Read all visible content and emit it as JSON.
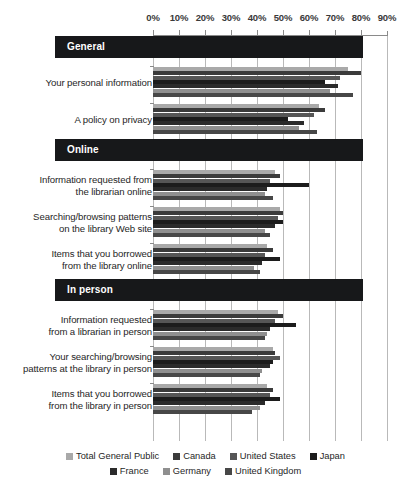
{
  "chart_data": {
    "type": "bar",
    "orientation": "horizontal",
    "title": "",
    "xlabel": "",
    "ylabel": "",
    "xlim": [
      0,
      90
    ],
    "xticks": [
      "0%",
      "10%",
      "20%",
      "30%",
      "40%",
      "50%",
      "60%",
      "70%",
      "80%",
      "90%"
    ],
    "xtick_values": [
      0,
      10,
      20,
      30,
      40,
      50,
      60,
      70,
      80,
      90
    ],
    "grid": true,
    "legend_position": "bottom",
    "series": [
      {
        "name": "Total General Public",
        "color": "#a9a9a9"
      },
      {
        "name": "Canada",
        "color": "#3b3b3b"
      },
      {
        "name": "United States",
        "color": "#565656"
      },
      {
        "name": "Japan",
        "color": "#1c1c1c"
      },
      {
        "name": "France",
        "color": "#2b2b2b"
      },
      {
        "name": "Germany",
        "color": "#8f8f8f"
      },
      {
        "name": "United Kingdom",
        "color": "#474747"
      }
    ],
    "sections": [
      {
        "name": "General",
        "groups": [
          {
            "label": "Your personal information",
            "label_lines": [
              "Your personal information"
            ],
            "values": [
              75,
              80,
              72,
              66,
              71,
              68,
              77
            ]
          },
          {
            "label": "A policy on privacy",
            "label_lines": [
              "A policy on privacy"
            ],
            "values": [
              64,
              66,
              62,
              52,
              58,
              56,
              63
            ]
          }
        ]
      },
      {
        "name": "Online",
        "groups": [
          {
            "label": "Information requested from the librarian online",
            "label_lines": [
              "Information requested from",
              "the librarian online"
            ],
            "values": [
              47,
              49,
              45,
              60,
              44,
              43,
              46
            ]
          },
          {
            "label": "Searching/browsing patterns on the library Web site",
            "label_lines": [
              "Searching/browsing patterns",
              "on the library Web site"
            ],
            "values": [
              49,
              50,
              48,
              50,
              47,
              43,
              45
            ]
          },
          {
            "label": "Items that you borrowed from the library online",
            "label_lines": [
              "Items that you borrowed",
              "from the library online"
            ],
            "values": [
              44,
              46,
              43,
              49,
              42,
              39,
              41
            ]
          }
        ]
      },
      {
        "name": "In person",
        "groups": [
          {
            "label": "Information requested from a librarian in person",
            "label_lines": [
              "Information requested",
              "from a librarian in person"
            ],
            "values": [
              48,
              50,
              47,
              55,
              45,
              44,
              43
            ]
          },
          {
            "label": "Your searching/browsing patterns at the library in person",
            "label_lines": [
              "Your searching/browsing",
              "patterns at the library in person"
            ],
            "values": [
              46,
              47,
              49,
              46,
              45,
              42,
              41
            ]
          },
          {
            "label": "Items that you borrowed from the library in person",
            "label_lines": [
              "Items that you borrowed",
              "from the library in person"
            ],
            "values": [
              44,
              46,
              45,
              49,
              43,
              41,
              38
            ]
          }
        ]
      }
    ],
    "legend_rows": [
      [
        "Total General Public",
        "Canada",
        "United States",
        "Japan"
      ],
      [
        "France",
        "Germany",
        "United Kingdom"
      ]
    ]
  }
}
